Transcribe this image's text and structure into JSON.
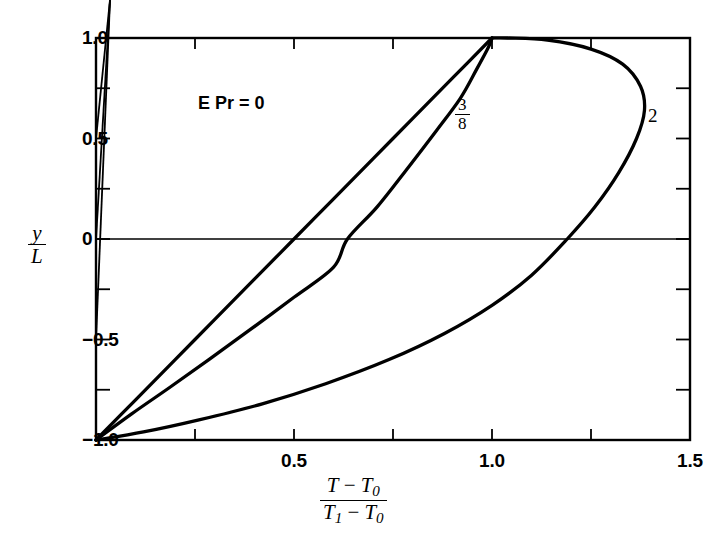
{
  "chart_data": {
    "type": "line",
    "title": "",
    "subtitle": "",
    "xlabel_parts": {
      "num_a": "T",
      "num_minus": "−",
      "num_b": "T",
      "num_b_sub": "0",
      "den_a": "T",
      "den_a_sub": "1",
      "den_minus": "−",
      "den_b": "T",
      "den_b_sub": "0"
    },
    "ylabel_parts": {
      "num": "y",
      "den": "L"
    },
    "xlim": [
      0,
      1.5
    ],
    "ylim": [
      -1.0,
      1.0
    ],
    "grid": false,
    "zero_line": true,
    "legend_position": "inline-annotations",
    "x_major_ticks": [
      0.5,
      1.0,
      1.5
    ],
    "x_major_tick_labels": [
      "0.5",
      "1.0",
      "1.5"
    ],
    "x_minor_ticks": [
      0.25,
      0.75,
      1.25
    ],
    "y_major_ticks": [
      1.0,
      0.5,
      0,
      -0.5,
      -1.0
    ],
    "y_major_tick_labels": [
      "1.0",
      "0.5",
      "0",
      "−0.5",
      "−1.0"
    ],
    "y_minor_ticks": [
      0.75,
      0.25,
      -0.25,
      -0.75
    ],
    "annotations": [
      {
        "name": "case-epr-0",
        "text": "E Pr = 0",
        "x": 0.33,
        "y": 0.72
      },
      {
        "name": "curve-label-3-8",
        "text": "3/8",
        "x": 0.935,
        "y": 0.6
      },
      {
        "name": "curve-label-2",
        "text": "2",
        "x": 1.41,
        "y": 0.6
      }
    ],
    "series": [
      {
        "name": "E Pr = 0",
        "label": "0",
        "points": [
          [
            0.0,
            -1.0
          ],
          [
            0.1,
            -0.8
          ],
          [
            0.2,
            -0.6
          ],
          [
            0.3,
            -0.4
          ],
          [
            0.4,
            -0.2
          ],
          [
            0.5,
            0.0
          ],
          [
            0.6,
            0.2
          ],
          [
            0.7,
            0.4
          ],
          [
            0.8,
            0.6
          ],
          [
            0.9,
            0.8
          ],
          [
            1.0,
            1.0
          ]
        ]
      },
      {
        "name": "E Pr = 3/8",
        "label": "3/8",
        "points": [
          [
            0.0,
            -1.0
          ],
          [
            0.09,
            -0.87
          ],
          [
            0.185,
            -0.74
          ],
          [
            0.285,
            -0.6
          ],
          [
            0.39,
            -0.45
          ],
          [
            0.5,
            -0.29
          ],
          [
            0.6,
            -0.14
          ],
          [
            0.635,
            0.0
          ],
          [
            0.71,
            0.16
          ],
          [
            0.79,
            0.36
          ],
          [
            0.86,
            0.54
          ],
          [
            0.92,
            0.7
          ],
          [
            0.96,
            0.84
          ],
          [
            0.99,
            0.95
          ],
          [
            1.0,
            1.0
          ]
        ]
      },
      {
        "name": "E Pr = 2",
        "label": "2",
        "points": [
          [
            0.0,
            -1.0
          ],
          [
            0.12,
            -0.96
          ],
          [
            0.26,
            -0.9
          ],
          [
            0.42,
            -0.82
          ],
          [
            0.58,
            -0.72
          ],
          [
            0.74,
            -0.6
          ],
          [
            0.88,
            -0.47
          ],
          [
            1.0,
            -0.33
          ],
          [
            1.1,
            -0.18
          ],
          [
            1.19,
            0.0
          ],
          [
            1.26,
            0.16
          ],
          [
            1.32,
            0.33
          ],
          [
            1.365,
            0.5
          ],
          [
            1.385,
            0.64
          ],
          [
            1.375,
            0.76
          ],
          [
            1.33,
            0.87
          ],
          [
            1.25,
            0.945
          ],
          [
            1.14,
            0.99
          ],
          [
            1.04,
            1.0
          ],
          [
            1.0,
            1.0
          ]
        ]
      }
    ]
  },
  "axes": {
    "frame_color": "#000000",
    "curve_color": "#000000"
  }
}
